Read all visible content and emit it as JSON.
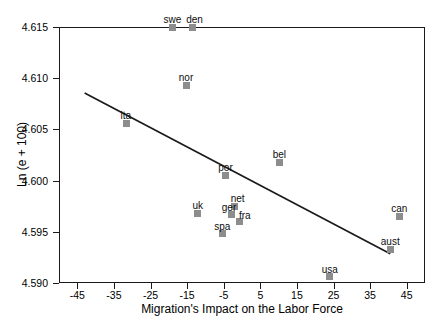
{
  "chart_data": {
    "type": "scatter",
    "title": "",
    "xlabel": "Migration's Impact on the Labor Force",
    "ylabel": "Ln (e + 100)",
    "xlim": [
      -50,
      50
    ],
    "ylim": [
      4.59,
      4.615
    ],
    "grid": false,
    "legend": "none",
    "xticks": [
      -45,
      -35,
      -25,
      -15,
      -5,
      5,
      15,
      25,
      35,
      45
    ],
    "xtick_labels": [
      "-45",
      "-35",
      "-25",
      "-15",
      "-5",
      "5",
      "15",
      "25",
      "35",
      "45"
    ],
    "yticks": [
      4.59,
      4.595,
      4.6,
      4.605,
      4.61,
      4.615
    ],
    "ytick_labels": [
      "4.590",
      "4.595",
      "4.600",
      "4.605",
      "4.610",
      "4.615"
    ],
    "points": [
      {
        "label": "swe",
        "x": -19.0,
        "y": 4.615,
        "lx": 0,
        "ly": -12
      },
      {
        "label": "den",
        "x": -13.5,
        "y": 4.615,
        "lx": 2,
        "ly": -12
      },
      {
        "label": "nor",
        "x": -15.3,
        "y": 4.6093,
        "lx": 0,
        "ly": -12
      },
      {
        "label": "ita",
        "x": -31.5,
        "y": 4.6056,
        "lx": -1,
        "ly": -12
      },
      {
        "label": "bel",
        "x": 10.2,
        "y": 4.6018,
        "lx": 0,
        "ly": -12
      },
      {
        "label": "por",
        "x": -4.5,
        "y": 4.6005,
        "lx": 0,
        "ly": -12
      },
      {
        "label": "net",
        "x": -2.0,
        "y": 4.5975,
        "lx": 3,
        "ly": -12
      },
      {
        "label": "ger",
        "x": -3.0,
        "y": 4.5967,
        "lx": -2,
        "ly": -11
      },
      {
        "label": "fra",
        "x": -0.6,
        "y": 4.596,
        "lx": 5,
        "ly": -11
      },
      {
        "label": "uk",
        "x": -12.1,
        "y": 4.5968,
        "lx": 0,
        "ly": -12
      },
      {
        "label": "spa",
        "x": -5.4,
        "y": 4.5948,
        "lx": 0,
        "ly": -12
      },
      {
        "label": "can",
        "x": 43.0,
        "y": 4.5965,
        "lx": 0,
        "ly": -12
      },
      {
        "label": "aust",
        "x": 40.5,
        "y": 4.5933,
        "lx": 0,
        "ly": -12
      },
      {
        "label": "usa",
        "x": 24.0,
        "y": 4.5906,
        "lx": 0,
        "ly": -12
      }
    ],
    "trendline": {
      "x_start": -43.0,
      "y_start": 4.60855,
      "x_end": 40.5,
      "y_end": 4.59285
    }
  }
}
